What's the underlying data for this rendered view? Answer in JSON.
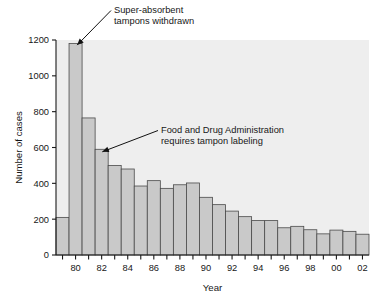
{
  "chart_data": {
    "type": "bar",
    "title": "",
    "xlabel": "Year",
    "ylabel": "Number of cases",
    "ylim": [
      0,
      1200
    ],
    "yticks": [
      0,
      200,
      400,
      600,
      800,
      1000,
      1200
    ],
    "ytick_labels": [
      "0",
      "200",
      "400",
      "600",
      "800",
      "1000",
      "1200"
    ],
    "xtick_labels": [
      "80",
      "82",
      "84",
      "86",
      "88",
      "90",
      "92",
      "94",
      "96",
      "98",
      "00",
      "02"
    ],
    "grid": false,
    "legend": null,
    "categories": [
      "79",
      "80",
      "81",
      "82",
      "83",
      "84",
      "85",
      "86",
      "87",
      "88",
      "89",
      "90",
      "91",
      "92",
      "93",
      "94",
      "95",
      "96",
      "97",
      "98",
      "99",
      "00",
      "01",
      "02"
    ],
    "values": [
      210,
      1180,
      765,
      590,
      500,
      480,
      385,
      415,
      372,
      392,
      402,
      322,
      281,
      245,
      214,
      192,
      192,
      152,
      160,
      141,
      118,
      139,
      132,
      116
    ],
    "annotations": [
      {
        "name": "super-absorbent-note",
        "line1": "Super-absorbent",
        "line2": "tampons withdrawn",
        "points_to_category": "80"
      },
      {
        "name": "fda-labeling-note",
        "line1": "Food and Drug Administration",
        "line2": "requires tampon labeling",
        "points_to_category": "82"
      }
    ],
    "colors": {
      "bar_fill": "#c9c9c9",
      "bar_edge": "#4a4a4a",
      "plot_background": "#eeeeee",
      "axis": "#1a1a1a",
      "text": "#171717",
      "page_background": "#ffffff"
    }
  }
}
